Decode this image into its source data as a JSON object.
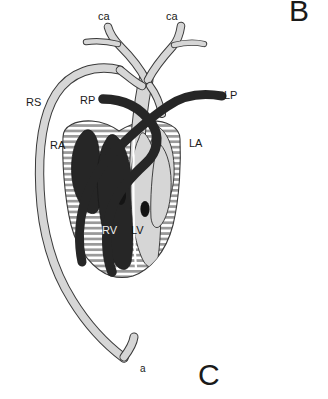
{
  "figure": {
    "type": "anatomical-diagram",
    "background_color": "#ffffff",
    "panel_letters": [
      {
        "id": "panel-b",
        "text": "B",
        "x": 289,
        "y": 2
      },
      {
        "id": "panel-c",
        "text": "C",
        "x": 198,
        "y": 362
      }
    ],
    "colors": {
      "oxygenated_light": "#d4d4d4",
      "deoxygenated_dark": "#262626",
      "hatch_line": "#8a8a8a",
      "outline": "#3a3a3a",
      "text": "#1a1a1a",
      "background": "#ffffff"
    },
    "labels": [
      {
        "id": "ca-left",
        "text": "ca",
        "x": 98,
        "y": 11,
        "desc": "left carotid artery"
      },
      {
        "id": "ca-right",
        "text": "ca",
        "x": 166,
        "y": 11,
        "desc": "right carotid artery"
      },
      {
        "id": "rs",
        "text": "RS",
        "x": 26,
        "y": 97,
        "desc": "right systemic arch"
      },
      {
        "id": "rp",
        "text": "RP",
        "x": 80,
        "y": 95,
        "desc": "right pulmonary artery"
      },
      {
        "id": "lp",
        "text": "LP",
        "x": 224,
        "y": 90,
        "desc": "left pulmonary artery"
      },
      {
        "id": "ra",
        "text": "RA",
        "x": 50,
        "y": 140,
        "desc": "right atrium"
      },
      {
        "id": "la",
        "text": "LA",
        "x": 189,
        "y": 138,
        "desc": "left atrium"
      },
      {
        "id": "rv",
        "text": "RV",
        "x": 102,
        "y": 225,
        "desc": "right ventricle"
      },
      {
        "id": "lv",
        "text": "LV",
        "x": 131,
        "y": 225,
        "desc": "left ventricle"
      },
      {
        "id": "a",
        "text": "a",
        "x": 140,
        "y": 364,
        "desc": "dorsal aorta"
      }
    ]
  }
}
